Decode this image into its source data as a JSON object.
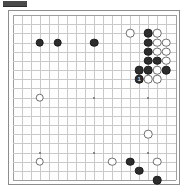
{
  "figure": {
    "kind": "go-board-diagram",
    "caption_label": "",
    "board_size": 19,
    "background_color": "#ffffff",
    "grid_color": "#c9c9c9",
    "border_color": "#8d8d8d",
    "black_color": "#2d2d2d",
    "white_color": "#ffffff"
  },
  "board": {
    "size": 19,
    "star_points": [
      {
        "col": 3,
        "row": 3
      },
      {
        "col": 9,
        "row": 3
      },
      {
        "col": 15,
        "row": 3
      },
      {
        "col": 3,
        "row": 9
      },
      {
        "col": 9,
        "row": 9
      },
      {
        "col": 15,
        "row": 9
      },
      {
        "col": 3,
        "row": 15
      },
      {
        "col": 9,
        "row": 15
      },
      {
        "col": 15,
        "row": 15
      }
    ],
    "stones": [
      {
        "col": 3,
        "row": 3,
        "color": "black",
        "label": ""
      },
      {
        "col": 5,
        "row": 3,
        "color": "black",
        "label": ""
      },
      {
        "col": 9,
        "row": 3,
        "color": "black",
        "label": ""
      },
      {
        "col": 15,
        "row": 3,
        "color": "black",
        "label": ""
      },
      {
        "col": 16,
        "row": 3,
        "color": "white",
        "label": ""
      },
      {
        "col": 17,
        "row": 3,
        "color": "white",
        "label": ""
      },
      {
        "col": 13,
        "row": 2,
        "color": "white",
        "label": ""
      },
      {
        "col": 15,
        "row": 2,
        "color": "black",
        "label": ""
      },
      {
        "col": 16,
        "row": 2,
        "color": "white",
        "label": ""
      },
      {
        "col": 15,
        "row": 4,
        "color": "black",
        "label": ""
      },
      {
        "col": 16,
        "row": 4,
        "color": "white",
        "label": ""
      },
      {
        "col": 17,
        "row": 4,
        "color": "white",
        "label": ""
      },
      {
        "col": 15,
        "row": 5,
        "color": "black",
        "label": ""
      },
      {
        "col": 16,
        "row": 5,
        "color": "black",
        "label": ""
      },
      {
        "col": 17,
        "row": 5,
        "color": "white",
        "label": ""
      },
      {
        "col": 14,
        "row": 6,
        "color": "black",
        "label": ""
      },
      {
        "col": 15,
        "row": 6,
        "color": "black",
        "label": ""
      },
      {
        "col": 16,
        "row": 6,
        "color": "white",
        "label": ""
      },
      {
        "col": 17,
        "row": 6,
        "color": "black",
        "label": ""
      },
      {
        "col": 14,
        "row": 7,
        "color": "black",
        "label": "1"
      },
      {
        "col": 15,
        "row": 7,
        "color": "white",
        "label": ""
      },
      {
        "col": 16,
        "row": 7,
        "color": "white",
        "label": ""
      },
      {
        "col": 3,
        "row": 9,
        "color": "white",
        "label": ""
      },
      {
        "col": 15,
        "row": 13,
        "color": "white",
        "label": ""
      },
      {
        "col": 3,
        "row": 16,
        "color": "white",
        "label": ""
      },
      {
        "col": 11,
        "row": 16,
        "color": "white",
        "label": ""
      },
      {
        "col": 13,
        "row": 16,
        "color": "black",
        "label": ""
      },
      {
        "col": 16,
        "row": 16,
        "color": "white",
        "label": ""
      },
      {
        "col": 14,
        "row": 17,
        "color": "black",
        "label": ""
      },
      {
        "col": 16,
        "row": 18,
        "color": "black",
        "label": ""
      }
    ]
  }
}
